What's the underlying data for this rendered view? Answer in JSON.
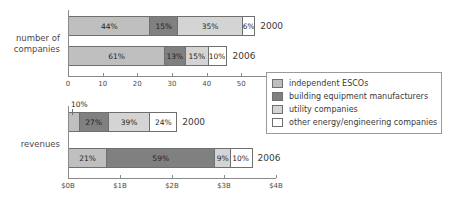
{
  "legend": {
    "position": "right-middle",
    "entries": [
      {
        "label": "independent ESCOs",
        "color": "#bfbfbf"
      },
      {
        "label": "building equipment manufacturers",
        "color": "#808080"
      },
      {
        "label": "utility companies",
        "color": "#d4d4d4"
      },
      {
        "label": "other energy/engineering companies",
        "color": "#ffffff"
      }
    ]
  },
  "panels": [
    {
      "category_label": "number of\ncompanies",
      "axis": {
        "min": 0,
        "max": 60,
        "ticks": [
          0,
          10,
          20,
          30,
          40,
          50,
          60
        ],
        "ticklabels": [
          "0",
          "10",
          "20",
          "30",
          "40",
          "50",
          "60"
        ]
      },
      "bars": [
        {
          "year": "2000",
          "total": 54,
          "segments": [
            {
              "series": "independent ESCOs",
              "label": "44%",
              "pct": 44
            },
            {
              "series": "building equipment manufacturers",
              "label": "15%",
              "pct": 15
            },
            {
              "series": "utility companies",
              "label": "35%",
              "pct": 35
            },
            {
              "series": "other energy/engineering companies",
              "label": "6%",
              "pct": 6
            }
          ]
        },
        {
          "year": "2006",
          "total": 46,
          "segments": [
            {
              "series": "independent ESCOs",
              "label": "61%",
              "pct": 61
            },
            {
              "series": "building equipment manufacturers",
              "label": "13%",
              "pct": 13
            },
            {
              "series": "utility companies",
              "label": "15%",
              "pct": 15
            },
            {
              "series": "other energy/engineering companies",
              "label": "10%",
              "pct": 10
            }
          ]
        }
      ]
    },
    {
      "category_label": "revenues",
      "axis": {
        "min": 0,
        "max": 4,
        "ticks": [
          0,
          1,
          2,
          3,
          4
        ],
        "ticklabels": [
          "$0B",
          "$1B",
          "$2B",
          "$3B",
          "$4B"
        ]
      },
      "bars": [
        {
          "year": "2000",
          "total": 2.1,
          "callout": {
            "label": "10%",
            "series": "independent ESCOs"
          },
          "segments": [
            {
              "series": "independent ESCOs",
              "label": "10%",
              "pct": 10,
              "label_callout": true
            },
            {
              "series": "building equipment manufacturers",
              "label": "27%",
              "pct": 27
            },
            {
              "series": "utility companies",
              "label": "39%",
              "pct": 39
            },
            {
              "series": "other energy/engineering companies",
              "label": "24%",
              "pct": 24
            }
          ]
        },
        {
          "year": "2006",
          "total": 3.55,
          "segments": [
            {
              "series": "independent ESCOs",
              "label": "21%",
              "pct": 21
            },
            {
              "series": "building equipment manufacturers",
              "label": "59%",
              "pct": 59
            },
            {
              "series": "utility companies",
              "label": "9%",
              "pct": 9
            },
            {
              "series": "other energy/engineering companies",
              "label": "10%",
              "pct": 10
            }
          ]
        }
      ]
    }
  ],
  "chart_data": {
    "type": "bar",
    "orientation": "horizontal",
    "stacked": true,
    "title": "",
    "xlabel": "",
    "ylabel": "",
    "grid": false,
    "legend_position": "right",
    "series": [
      {
        "name": "independent ESCOs",
        "color": "#bfbfbf"
      },
      {
        "name": "building equipment manufacturers",
        "color": "#808080"
      },
      {
        "name": "utility companies",
        "color": "#d4d4d4"
      },
      {
        "name": "other energy/engineering companies",
        "color": "#ffffff"
      }
    ],
    "subplots": [
      {
        "name": "number of companies",
        "xlim": [
          0,
          60
        ],
        "xticks": [
          0,
          10,
          20,
          30,
          40,
          50,
          60
        ],
        "xticklabels": [
          "0",
          "10",
          "20",
          "30",
          "40",
          "50",
          "60"
        ],
        "categories": [
          "2000",
          "2006"
        ],
        "totals": [
          54,
          46
        ],
        "percentages": {
          "2000": [
            44,
            15,
            35,
            6
          ],
          "2006": [
            61,
            13,
            15,
            10
          ]
        }
      },
      {
        "name": "revenues",
        "xlim": [
          0,
          4
        ],
        "xticks": [
          0,
          1,
          2,
          3,
          4
        ],
        "xticklabels": [
          "$0B",
          "$1B",
          "$2B",
          "$3B",
          "$4B"
        ],
        "categories": [
          "2000",
          "2006"
        ],
        "totals": [
          2.1,
          3.55
        ],
        "percentages": {
          "2000": [
            10,
            27,
            39,
            24
          ],
          "2006": [
            21,
            59,
            9,
            10
          ]
        }
      }
    ],
    "annotations": [
      {
        "text": "10%",
        "refers_to": "revenues 2000 independent ESCOs segment"
      }
    ]
  }
}
